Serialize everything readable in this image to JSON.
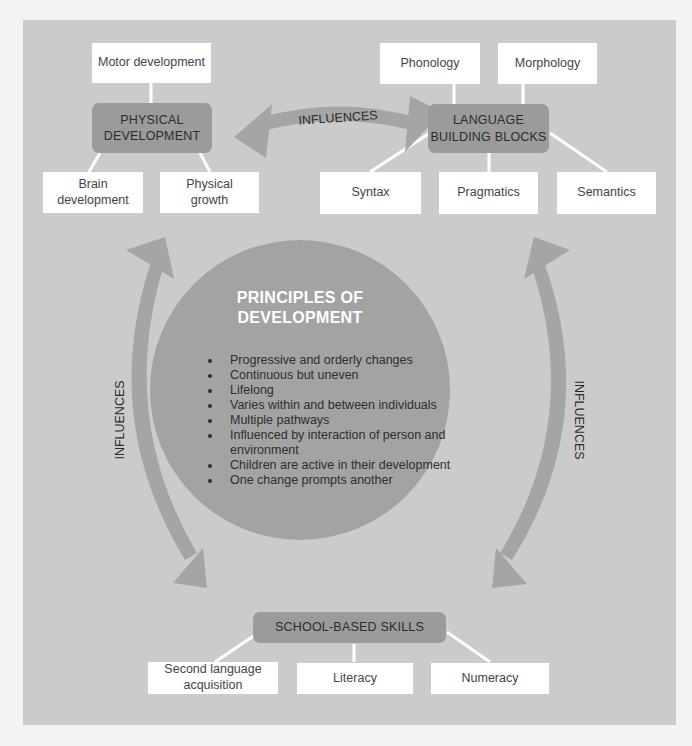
{
  "diagram": {
    "background_color": "#cbcbcb",
    "hub_color": "#9b9b9b",
    "arrow_color": "#a5a5a5",
    "circle_color": "#a3a3a3",
    "physical": {
      "hub": [
        "PHYSICAL",
        "DEVELOPMENT"
      ],
      "children": [
        {
          "label": [
            "Motor development"
          ]
        },
        {
          "label": [
            "Brain",
            "development"
          ]
        },
        {
          "label": [
            "Physical",
            "growth"
          ]
        }
      ]
    },
    "language": {
      "hub": [
        "LANGUAGE",
        "BUILDING BLOCKS"
      ],
      "children": [
        {
          "label": [
            "Phonology"
          ]
        },
        {
          "label": [
            "Morphology"
          ]
        },
        {
          "label": [
            "Syntax"
          ]
        },
        {
          "label": [
            "Pragmatics"
          ]
        },
        {
          "label": [
            "Semantics"
          ]
        }
      ]
    },
    "school": {
      "hub": [
        "SCHOOL-BASED SKILLS"
      ],
      "children": [
        {
          "label": [
            "Second language",
            "acquisition"
          ]
        },
        {
          "label": [
            "Literacy"
          ]
        },
        {
          "label": [
            "Numeracy"
          ]
        }
      ]
    },
    "center": {
      "title": [
        "PRINCIPLES OF",
        "DEVELOPMENT"
      ],
      "principles": [
        "Progressive and orderly changes",
        "Continuous but uneven",
        "Lifelong",
        "Varies within and between individuals",
        "Multiple pathways",
        "Influenced by interaction of person and environment",
        "Children are active in their development",
        "One change prompts another"
      ]
    },
    "arrows": {
      "top": "INFLUENCES",
      "left": "INFLUENCES",
      "right": "INFLUENCES"
    }
  }
}
